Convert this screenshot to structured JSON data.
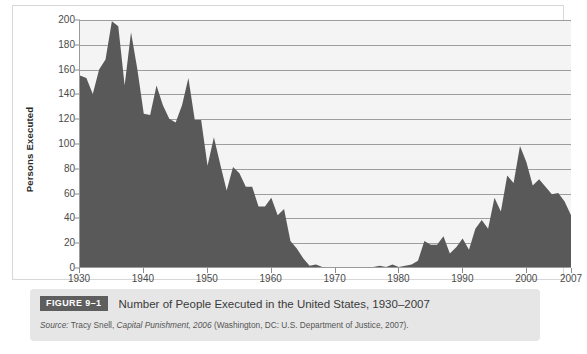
{
  "figure": {
    "badge_label": "FIGURE 9–1",
    "title": "Number of People Executed in the United States, 1930–2007",
    "source_lead": "Source:",
    "source_author": " Tracy Snell, ",
    "source_work": "Capital Punishment, 2006",
    "source_rest": " (Washington, DC: U.S. Department of Justice, 2007)."
  },
  "colors": {
    "area_fill": "#595959",
    "plot_background": "#f4f4f4",
    "gridline": "#9d9d9d",
    "axis": "#9a9a9a",
    "badge_background": "#5e5e5e",
    "caption_background": "#e6e6e6"
  },
  "chart_data": {
    "type": "area",
    "title": "Number of People Executed in the United States, 1930–2007",
    "xlabel": "",
    "ylabel": "Persons Executed",
    "xlim": [
      1930,
      2007
    ],
    "ylim": [
      0,
      200
    ],
    "grid": true,
    "legend": "none",
    "y_ticks": [
      0,
      20,
      40,
      60,
      80,
      100,
      120,
      140,
      160,
      180,
      200
    ],
    "x_ticks": [
      1930,
      1940,
      1950,
      1960,
      1970,
      1980,
      1990,
      2000,
      2007
    ],
    "x_tick_labels": [
      "1930",
      "1940",
      "1950",
      "1960",
      "1970",
      "1980",
      "1990",
      "2000",
      "2007"
    ],
    "y_tick_labels": [
      "0",
      "20",
      "40",
      "60",
      "80",
      "100",
      "120",
      "140",
      "160",
      "180",
      "200"
    ],
    "x": [
      1930,
      1931,
      1932,
      1933,
      1934,
      1935,
      1936,
      1937,
      1938,
      1939,
      1940,
      1941,
      1942,
      1943,
      1944,
      1945,
      1946,
      1947,
      1948,
      1949,
      1950,
      1951,
      1952,
      1953,
      1954,
      1955,
      1956,
      1957,
      1958,
      1959,
      1960,
      1961,
      1962,
      1963,
      1964,
      1965,
      1966,
      1967,
      1968,
      1969,
      1970,
      1971,
      1972,
      1973,
      1974,
      1975,
      1976,
      1977,
      1978,
      1979,
      1980,
      1981,
      1982,
      1983,
      1984,
      1985,
      1986,
      1987,
      1988,
      1989,
      1990,
      1991,
      1992,
      1993,
      1994,
      1995,
      1996,
      1997,
      1998,
      1999,
      2000,
      2001,
      2002,
      2003,
      2004,
      2005,
      2006,
      2007
    ],
    "values": [
      155,
      153,
      140,
      160,
      168,
      199,
      195,
      147,
      190,
      160,
      124,
      123,
      147,
      131,
      120,
      117,
      131,
      153,
      119,
      119,
      82,
      105,
      83,
      62,
      81,
      76,
      65,
      65,
      49,
      49,
      56,
      42,
      47,
      21,
      15,
      7,
      1,
      2,
      0,
      0,
      0,
      0,
      0,
      0,
      0,
      0,
      0,
      1,
      0,
      2,
      0,
      1,
      2,
      5,
      21,
      18,
      18,
      25,
      11,
      16,
      23,
      14,
      31,
      38,
      31,
      56,
      45,
      74,
      68,
      98,
      85,
      66,
      71,
      65,
      59,
      60,
      53,
      42
    ],
    "series": [
      {
        "name": "Persons Executed",
        "values": [
          155,
          153,
          140,
          160,
          168,
          199,
          195,
          147,
          190,
          160,
          124,
          123,
          147,
          131,
          120,
          117,
          131,
          153,
          119,
          119,
          82,
          105,
          83,
          62,
          81,
          76,
          65,
          65,
          49,
          49,
          56,
          42,
          47,
          21,
          15,
          7,
          1,
          2,
          0,
          0,
          0,
          0,
          0,
          0,
          0,
          0,
          0,
          1,
          0,
          2,
          0,
          1,
          2,
          5,
          21,
          18,
          18,
          25,
          11,
          16,
          23,
          14,
          31,
          38,
          31,
          56,
          45,
          74,
          68,
          98,
          85,
          66,
          71,
          65,
          59,
          60,
          53,
          42
        ]
      }
    ]
  }
}
